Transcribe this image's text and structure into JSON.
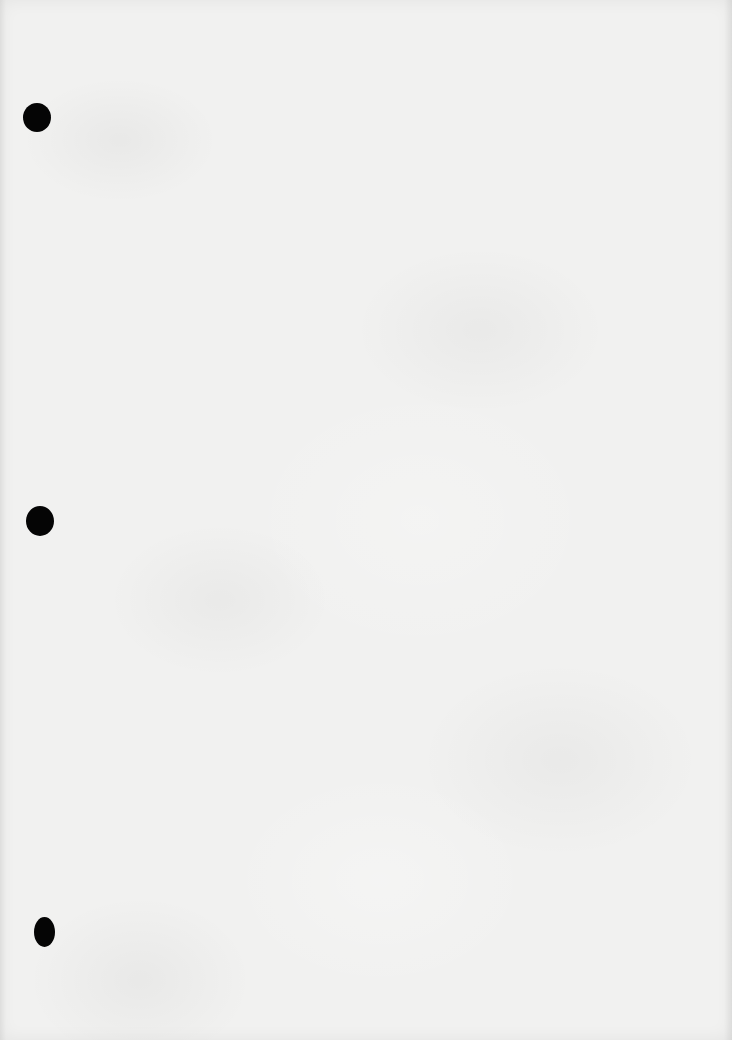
{
  "document": {
    "type": "blank-sheet",
    "background_color": "#f1f1f0",
    "text_content": ""
  },
  "punch_holes": [
    {
      "cx": 37,
      "cy": 117,
      "w": 28,
      "h": 29,
      "color": "#050505"
    },
    {
      "cx": 40,
      "cy": 521,
      "w": 28,
      "h": 30,
      "color": "#050505"
    },
    {
      "cx": 44,
      "cy": 932,
      "w": 21,
      "h": 30,
      "color": "#050505"
    }
  ]
}
